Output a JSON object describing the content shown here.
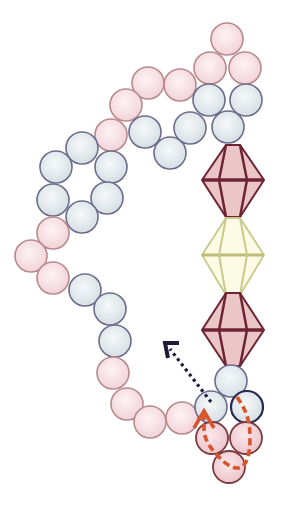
{
  "diagram": {
    "width": 289,
    "height": 506,
    "colors": {
      "background": "#ffffff",
      "pink_fill": "#f6dde2",
      "pink_stroke": "#b88a8e",
      "pink_dark_fill": "#f0cdd3",
      "pink_dark_stroke": "#7a3b40",
      "blue_fill": "#e3e9ec",
      "blue_stroke": "#6e6c8c",
      "blue_dark_stroke": "#2a2a50",
      "bicone_fill": "#e8c2c4",
      "bicone_stroke": "#6e2434",
      "bicone_yellow_fill": "#fafbe4",
      "bicone_yellow_stroke": "#c9c98a",
      "arrow_black": "#1c1c3a",
      "arrow_red": "#d9542a"
    },
    "bead_radius": 16,
    "round_beads": [
      {
        "x": 227,
        "y": 39,
        "color": "pink"
      },
      {
        "x": 210,
        "y": 68,
        "color": "pink"
      },
      {
        "x": 245,
        "y": 68,
        "color": "pink"
      },
      {
        "x": 180,
        "y": 85,
        "color": "pink"
      },
      {
        "x": 148,
        "y": 83,
        "color": "pink"
      },
      {
        "x": 126,
        "y": 105,
        "color": "pink"
      },
      {
        "x": 111,
        "y": 135,
        "color": "pink"
      },
      {
        "x": 209,
        "y": 100,
        "color": "blue"
      },
      {
        "x": 246,
        "y": 100,
        "color": "blue"
      },
      {
        "x": 228,
        "y": 127,
        "color": "blue"
      },
      {
        "x": 190,
        "y": 128,
        "color": "blue"
      },
      {
        "x": 145,
        "y": 132,
        "color": "blue"
      },
      {
        "x": 170,
        "y": 153,
        "color": "blue"
      },
      {
        "x": 82,
        "y": 148,
        "color": "blue"
      },
      {
        "x": 56,
        "y": 167,
        "color": "blue"
      },
      {
        "x": 111,
        "y": 167,
        "color": "blue"
      },
      {
        "x": 53,
        "y": 200,
        "color": "blue"
      },
      {
        "x": 107,
        "y": 198,
        "color": "blue"
      },
      {
        "x": 82,
        "y": 217,
        "color": "blue"
      },
      {
        "x": 53,
        "y": 233,
        "color": "pink"
      },
      {
        "x": 31,
        "y": 256,
        "color": "pink"
      },
      {
        "x": 53,
        "y": 278,
        "color": "pink"
      },
      {
        "x": 85,
        "y": 290,
        "color": "blue"
      },
      {
        "x": 110,
        "y": 309,
        "color": "blue"
      },
      {
        "x": 115,
        "y": 341,
        "color": "blue"
      },
      {
        "x": 113,
        "y": 373,
        "color": "pink"
      },
      {
        "x": 127,
        "y": 404,
        "color": "pink"
      },
      {
        "x": 150,
        "y": 422,
        "color": "pink"
      },
      {
        "x": 182,
        "y": 418,
        "color": "pink"
      },
      {
        "x": 231,
        "y": 381,
        "color": "blue"
      },
      {
        "x": 211,
        "y": 407,
        "color": "blue"
      },
      {
        "x": 247,
        "y": 407,
        "color": "blue_dark"
      },
      {
        "x": 212,
        "y": 438,
        "color": "pink_dark"
      },
      {
        "x": 246,
        "y": 438,
        "color": "pink_dark"
      },
      {
        "x": 229,
        "y": 467,
        "color": "pink_dark"
      }
    ],
    "bicones": [
      {
        "cx": 233,
        "top": 145,
        "mid": 180,
        "bottom": 217,
        "half_width": 31,
        "color": "rose"
      },
      {
        "cx": 233,
        "top": 218,
        "mid": 255,
        "bottom": 295,
        "half_width": 31,
        "color": "yellow"
      },
      {
        "cx": 233,
        "top": 293,
        "mid": 330,
        "bottom": 366,
        "half_width": 31,
        "color": "rose"
      }
    ],
    "arrows": [
      {
        "name": "thread-path-black-dotted",
        "style": "dotted",
        "color": "arrow_black",
        "from": [
          211,
          400
        ],
        "to": [
          166,
          344
        ]
      },
      {
        "name": "thread-path-red-dashed",
        "style": "dashed",
        "color": "arrow_red"
      }
    ]
  }
}
